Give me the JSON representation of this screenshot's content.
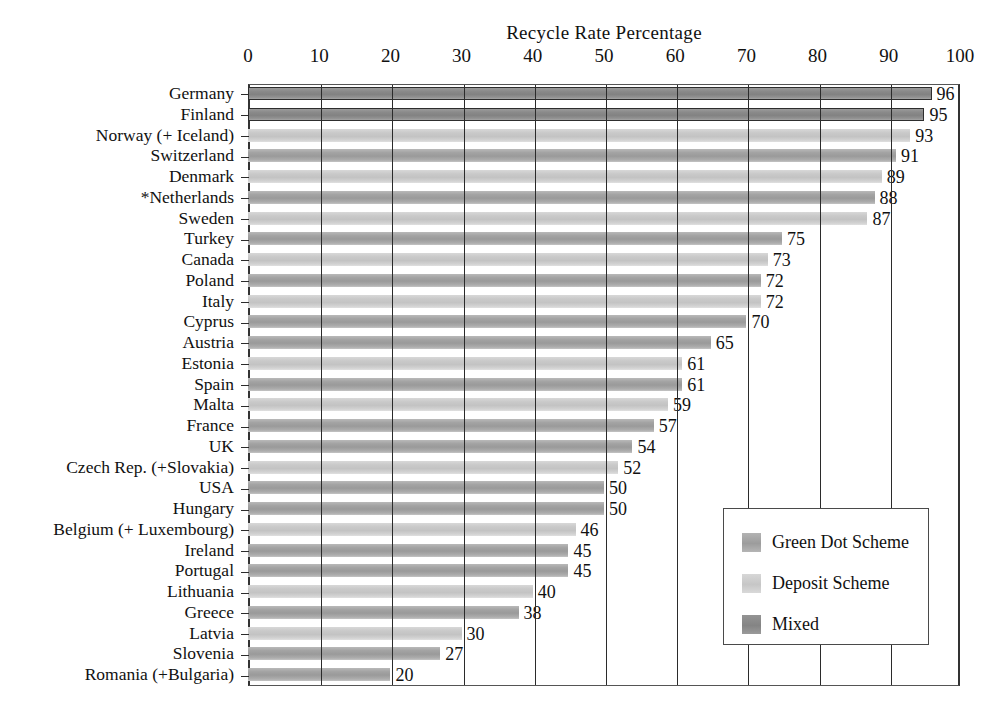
{
  "chart_data": {
    "type": "bar",
    "orientation": "horizontal",
    "title": "Recycle Rate Percentage",
    "xlabel": "",
    "ylabel": "",
    "xlim": [
      0,
      100
    ],
    "xticks": [
      0,
      10,
      20,
      30,
      40,
      50,
      60,
      70,
      80,
      90,
      100
    ],
    "grid": true,
    "legend_position": "bottom-right",
    "categories": [
      "Germany",
      "Finland",
      "Norway (+ Iceland)",
      "Switzerland",
      "Denmark",
      "*Netherlands",
      "Sweden",
      "Turkey",
      "Canada",
      "Poland",
      "Italy",
      "Cyprus",
      "Austria",
      "Estonia",
      "Spain",
      "Malta",
      "France",
      "UK",
      "Czech Rep. (+Slovakia)",
      "USA",
      "Hungary",
      "Belgium (+ Luxembourg)",
      "Ireland",
      "Portugal",
      "Lithuania",
      "Greece",
      "Latvia",
      "Slovenia",
      "Romania (+Bulgaria)"
    ],
    "values": [
      96,
      95,
      93,
      91,
      89,
      88,
      87,
      75,
      73,
      72,
      72,
      70,
      65,
      61,
      61,
      59,
      57,
      54,
      52,
      50,
      50,
      46,
      45,
      45,
      40,
      38,
      30,
      27,
      20
    ],
    "schemes": [
      "mixed",
      "mixed",
      "deposit",
      "green",
      "deposit",
      "green",
      "deposit",
      "green",
      "deposit",
      "green",
      "deposit",
      "green",
      "green",
      "deposit",
      "green",
      "deposit",
      "green",
      "green",
      "deposit",
      "green",
      "green",
      "deposit",
      "green",
      "green",
      "deposit",
      "green",
      "deposit",
      "green",
      "green"
    ],
    "legend": [
      {
        "key": "green",
        "label": "Green Dot Scheme",
        "color": "#9c9c9c"
      },
      {
        "key": "deposit",
        "label": "Deposit Scheme",
        "color": "#c8c8c8"
      },
      {
        "key": "mixed",
        "label": "Mixed",
        "color": "#858585"
      }
    ]
  }
}
